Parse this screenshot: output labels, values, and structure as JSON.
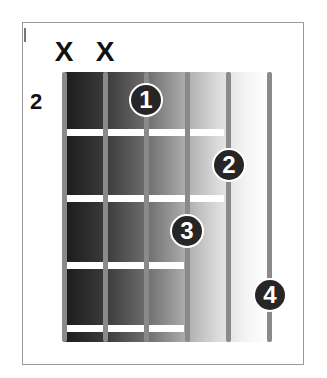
{
  "diagram": {
    "type": "guitar-chord-chart",
    "starting_fret_label": "2",
    "muted_strings": [
      {
        "string_index": 0,
        "label": "X"
      },
      {
        "string_index": 1,
        "label": "X"
      }
    ],
    "string_count": 6,
    "fret_count": 4,
    "fingers": [
      {
        "label": "1",
        "string_index": 2,
        "fret": 1
      },
      {
        "label": "2",
        "string_index": 4,
        "fret": 2
      },
      {
        "label": "3",
        "string_index": 3,
        "fret": 3
      },
      {
        "label": "4",
        "string_index": 5,
        "fret": 4
      }
    ],
    "colors": {
      "finger_fill": "#262626",
      "finger_text": "#ffffff",
      "string": "#8a8a8a",
      "fret": "#ffffff",
      "border": "#9a9a9a"
    }
  }
}
